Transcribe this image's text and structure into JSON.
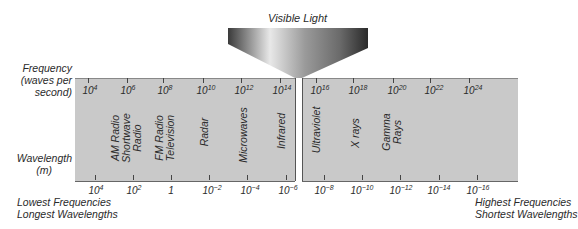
{
  "title": "Visible Light",
  "axes": {
    "frequency_label_line1": "Frequency",
    "frequency_label_line2": "(waves per",
    "frequency_label_line3": "second)",
    "wavelength_label_line1": "Wavelength",
    "wavelength_label_line2": "(m)"
  },
  "frequency_ticks": [
    {
      "base": "10",
      "exp": "4"
    },
    {
      "base": "10",
      "exp": "6"
    },
    {
      "base": "10",
      "exp": "8"
    },
    {
      "base": "10",
      "exp": "10"
    },
    {
      "base": "10",
      "exp": "12"
    },
    {
      "base": "10",
      "exp": "14"
    },
    {
      "base": "10",
      "exp": "16"
    },
    {
      "base": "10",
      "exp": "18"
    },
    {
      "base": "10",
      "exp": "20"
    },
    {
      "base": "10",
      "exp": "22"
    },
    {
      "base": "10",
      "exp": "24"
    }
  ],
  "wavelength_ticks": [
    {
      "base": "10",
      "exp": "4"
    },
    {
      "base": "10",
      "exp": "2"
    },
    {
      "base": "1",
      "exp": ""
    },
    {
      "base": "10",
      "exp": "−2"
    },
    {
      "base": "10",
      "exp": "−4"
    },
    {
      "base": "10",
      "exp": "−6"
    },
    {
      "base": "10",
      "exp": "−8"
    },
    {
      "base": "10",
      "exp": "−10"
    },
    {
      "base": "10",
      "exp": "−12"
    },
    {
      "base": "10",
      "exp": "−14"
    },
    {
      "base": "10",
      "exp": "−16"
    }
  ],
  "regions": [
    {
      "line1": "AM Radio",
      "line2": "Shortwave",
      "line3": "Radio"
    },
    {
      "line1": "FM Radio",
      "line2": "Television"
    },
    {
      "line1": "Radar"
    },
    {
      "line1": "Microwaves"
    },
    {
      "line1": "Infrared"
    },
    {
      "line1": "Ultraviolet"
    },
    {
      "line1": "X rays"
    },
    {
      "line1": "Gamma",
      "line2": "Rays"
    }
  ],
  "left_caption": {
    "line1": "Lowest Frequencies",
    "line2": "Longest Wavelengths"
  },
  "right_caption": {
    "line1": "Highest Frequencies",
    "line2": "Shortest Wavelengths"
  }
}
